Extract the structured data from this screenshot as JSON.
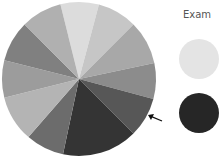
{
  "chart_data": {
    "type": "pie",
    "title": "",
    "legend_title": "Exam",
    "center": [
      79,
      79
    ],
    "radius": 77,
    "slices": [
      {
        "start": -104,
        "end": -75,
        "color": "#dcdcdc"
      },
      {
        "start": -75,
        "end": -45,
        "color": "#c6c6c6"
      },
      {
        "start": -45,
        "end": -12,
        "color": "#a8a8a8"
      },
      {
        "start": -12,
        "end": 15,
        "color": "#8c8c8c"
      },
      {
        "start": 15,
        "end": 45,
        "color": "#575757"
      },
      {
        "start": 45,
        "end": 102,
        "color": "#343434"
      },
      {
        "start": 102,
        "end": 131,
        "color": "#6c6c6c"
      },
      {
        "start": 131,
        "end": 166,
        "color": "#b4b4b4"
      },
      {
        "start": 166,
        "end": 194,
        "color": "#9c9c9c"
      },
      {
        "start": 194,
        "end": 225,
        "color": "#808080"
      },
      {
        "start": 225,
        "end": 256,
        "color": "#b0b0b0"
      }
    ],
    "legend": [
      {
        "color": "#e4e4e4",
        "cx": 199,
        "cy": 59,
        "r": 20
      },
      {
        "color": "#262626",
        "cx": 199,
        "cy": 113,
        "r": 20
      }
    ],
    "annotation": {
      "type": "arrow",
      "x1": 162,
      "y1": 121,
      "x2": 148,
      "y2": 115
    }
  }
}
